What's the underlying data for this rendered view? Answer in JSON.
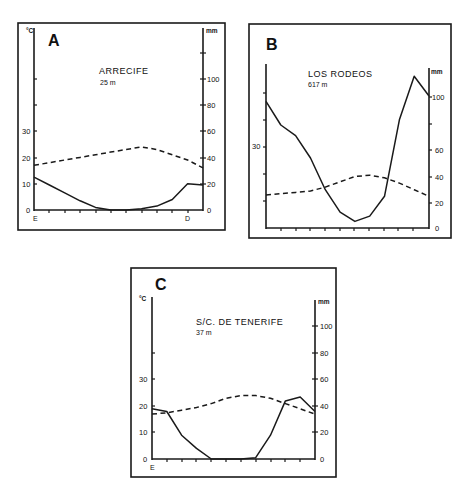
{
  "figure": {
    "panels": [
      {
        "letter": "A",
        "station": "ARRECIFE",
        "altitude": "25 m",
        "left_unit": "°C",
        "right_unit": "mm",
        "left_ticks": [
          "0",
          "10",
          "20",
          "30"
        ],
        "right_ticks": [
          "0",
          "20",
          "40",
          "60",
          "80",
          "100"
        ],
        "x_start_label": "E",
        "x_end_label": "D"
      },
      {
        "letter": "B",
        "station": "LOS RODEOS",
        "altitude": "617 m",
        "left_unit": "",
        "right_unit": "mm",
        "left_ticks": [
          "30"
        ],
        "right_ticks": [
          "0",
          "20",
          "40",
          "60",
          "100"
        ],
        "x_start_label": "",
        "x_end_label": ""
      },
      {
        "letter": "C",
        "station": "S/C. DE TENERIFE",
        "altitude": "37 m",
        "left_unit": "°C",
        "right_unit": "mm",
        "left_ticks": [
          "0",
          "10",
          "20",
          "30"
        ],
        "right_ticks": [
          "0",
          "20",
          "40",
          "60",
          "80",
          "100"
        ],
        "x_start_label": "E",
        "x_end_label": ""
      }
    ]
  },
  "chart_data": [
    {
      "type": "line",
      "title": "A — ARRECIFE, 25 m",
      "subtitle": "Ombrothermic diagram",
      "categories": [
        "E",
        "F",
        "M",
        "A",
        "M",
        "J",
        "J",
        "A",
        "S",
        "O",
        "N",
        "D"
      ],
      "xlabel": "",
      "ylabel_left": "°C",
      "ylabel_right": "mm",
      "ylim_left": [
        0,
        50
      ],
      "ylim_right": [
        0,
        100
      ],
      "series": [
        {
          "name": "Precipitation (mm)",
          "style": "solid",
          "axis": "right",
          "values": [
            25,
            19,
            13,
            7,
            2,
            0,
            0,
            1,
            3,
            8,
            20,
            19
          ]
        },
        {
          "name": "Temperature (°C)",
          "style": "dashed",
          "axis": "left",
          "values": [
            17,
            18,
            19,
            20,
            21,
            22,
            23,
            24,
            23,
            21,
            19,
            16
          ]
        }
      ],
      "grid": false,
      "legend": "none"
    },
    {
      "type": "line",
      "title": "B — LOS RODEOS, 617 m",
      "subtitle": "Ombrothermic diagram",
      "categories": [
        "E",
        "F",
        "M",
        "A",
        "M",
        "J",
        "J",
        "A",
        "S",
        "O",
        "N",
        "D"
      ],
      "xlabel": "",
      "ylabel_left": "°C",
      "ylabel_right": "mm",
      "ylim_left": [
        0,
        50
      ],
      "ylim_right": [
        0,
        100
      ],
      "series": [
        {
          "name": "Precipitation (mm)",
          "style": "solid",
          "axis": "right",
          "values": [
            96,
            78,
            70,
            53,
            29,
            12,
            5,
            9,
            24,
            82,
            115,
            100
          ]
        },
        {
          "name": "Temperature (°C)",
          "style": "dashed",
          "axis": "left",
          "values": [
            12.5,
            13,
            13.5,
            14,
            15.5,
            17.5,
            19.5,
            20,
            19,
            17,
            14.5,
            12
          ]
        }
      ],
      "grid": false,
      "legend": "none"
    },
    {
      "type": "line",
      "title": "C — S/C. DE TENERIFE, 37 m",
      "subtitle": "Ombrothermic diagram",
      "categories": [
        "E",
        "F",
        "M",
        "A",
        "M",
        "J",
        "J",
        "A",
        "S",
        "O",
        "N",
        "D"
      ],
      "xlabel": "",
      "ylabel_left": "°C",
      "ylabel_right": "mm",
      "ylim_left": [
        0,
        50
      ],
      "ylim_right": [
        0,
        100
      ],
      "series": [
        {
          "name": "Precipitation (mm)",
          "style": "solid",
          "axis": "right",
          "values": [
            38,
            36,
            18,
            8,
            0,
            0,
            0,
            1,
            18,
            44,
            47,
            36
          ]
        },
        {
          "name": "Temperature (°C)",
          "style": "dashed",
          "axis": "left",
          "values": [
            17,
            17.5,
            18.5,
            19.5,
            21,
            23,
            24,
            24,
            23,
            21,
            19,
            17
          ]
        }
      ],
      "grid": false,
      "legend": "none"
    }
  ]
}
